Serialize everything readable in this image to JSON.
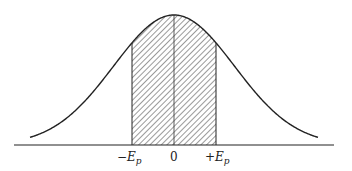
{
  "diagram": {
    "type": "normal-distribution-curve",
    "colors": {
      "stroke": "#222222",
      "hatch": "#555555",
      "background": "#ffffff"
    },
    "labels": {
      "left_sign": "−",
      "left_var": "E",
      "left_sub": "p",
      "center": "0",
      "right_sign": "+",
      "right_var": "E",
      "right_sub": "p"
    },
    "shaded_region": {
      "from": "-Ep",
      "to": "+Ep",
      "pattern": "diagonal-hatch"
    }
  }
}
